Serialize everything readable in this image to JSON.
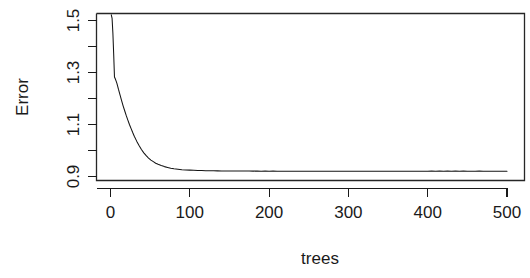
{
  "chart_data": {
    "type": "line",
    "title": "",
    "xlabel": "trees",
    "ylabel": "Error",
    "xlim": [
      0,
      500
    ],
    "ylim": [
      0.88,
      1.53
    ],
    "grid": false,
    "legend": null,
    "box": true,
    "x_ticks": [
      0,
      100,
      200,
      300,
      400,
      500
    ],
    "x_tick_labels": [
      "0",
      "100",
      "200",
      "300",
      "400",
      "500"
    ],
    "y_ticks": [
      0.9,
      1.0,
      1.1,
      1.2,
      1.3,
      1.4,
      1.5
    ],
    "y_tick_labels": [
      "0.9",
      "",
      "1.1",
      "",
      "1.3",
      "",
      "1.5"
    ],
    "y_labeled_ticks": [
      0.9,
      1.1,
      1.3,
      1.5
    ],
    "series": [
      {
        "name": "OOB Error",
        "color": "#141414",
        "x": [
          1,
          2,
          3,
          4,
          5,
          6,
          7,
          8,
          9,
          10,
          12,
          14,
          16,
          18,
          20,
          22,
          24,
          26,
          28,
          30,
          33,
          36,
          39,
          42,
          45,
          48,
          51,
          54,
          57,
          60,
          64,
          68,
          72,
          76,
          80,
          85,
          90,
          95,
          100,
          105,
          110,
          115,
          120,
          125,
          130,
          135,
          140,
          145,
          150,
          155,
          160,
          165,
          170,
          175,
          180,
          185,
          190,
          195,
          200,
          205,
          210,
          215,
          220,
          230,
          240,
          250,
          260,
          270,
          280,
          290,
          300,
          310,
          320,
          330,
          340,
          350,
          360,
          370,
          380,
          390,
          400,
          405,
          410,
          415,
          420,
          425,
          430,
          435,
          440,
          445,
          450,
          455,
          460,
          465,
          470,
          475,
          480,
          485,
          490,
          495,
          500
        ],
        "y": [
          1.522,
          1.508,
          1.452,
          1.372,
          1.283,
          1.276,
          1.268,
          1.259,
          1.248,
          1.236,
          1.214,
          1.192,
          1.171,
          1.152,
          1.133,
          1.116,
          1.099,
          1.084,
          1.069,
          1.055,
          1.036,
          1.019,
          1.004,
          0.991,
          0.98,
          0.971,
          0.963,
          0.957,
          0.951,
          0.947,
          0.942,
          0.938,
          0.935,
          0.932,
          0.93,
          0.928,
          0.926,
          0.925,
          0.9245,
          0.9238,
          0.9232,
          0.9228,
          0.9224,
          0.9221,
          0.9219,
          0.9216,
          0.9214,
          0.9212,
          0.921,
          0.9213,
          0.9209,
          0.9212,
          0.9208,
          0.921,
          0.9206,
          0.9209,
          0.9205,
          0.9207,
          0.9204,
          0.9206,
          0.9203,
          0.9205,
          0.9202,
          0.9202,
          0.9202,
          0.9202,
          0.9202,
          0.9202,
          0.9202,
          0.9202,
          0.9202,
          0.9202,
          0.9202,
          0.9202,
          0.9202,
          0.9202,
          0.9202,
          0.9202,
          0.9202,
          0.9202,
          0.9202,
          0.9206,
          0.9201,
          0.9207,
          0.92,
          0.9206,
          0.92,
          0.9207,
          0.9201,
          0.9206,
          0.92,
          0.9205,
          0.92,
          0.9206,
          0.9201,
          0.9205,
          0.92,
          0.9204,
          0.9201,
          0.9204,
          0.9202
        ]
      }
    ]
  }
}
